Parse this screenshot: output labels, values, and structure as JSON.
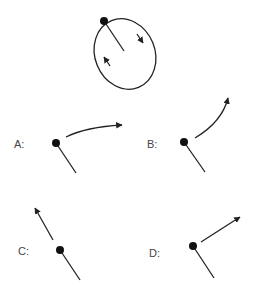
{
  "diagram": {
    "colors": {
      "stroke": "#222222",
      "label": "#444444",
      "background": "#ffffff"
    },
    "top_figure": {
      "shape": "ellipse",
      "direction": "clockwise",
      "arrows": [
        "down-right arrow on right side",
        "up-left arrow on left side"
      ]
    },
    "options": [
      {
        "id": "A",
        "label": "A:",
        "trajectory": "curved arrow curving right"
      },
      {
        "id": "B",
        "label": "B:",
        "trajectory": "curved arrow curving up"
      },
      {
        "id": "C",
        "label": "C:",
        "trajectory": "straight arrow up-left, along the rod"
      },
      {
        "id": "D",
        "label": "D:",
        "trajectory": "straight arrow up-right, perpendicular to rod"
      }
    ]
  }
}
